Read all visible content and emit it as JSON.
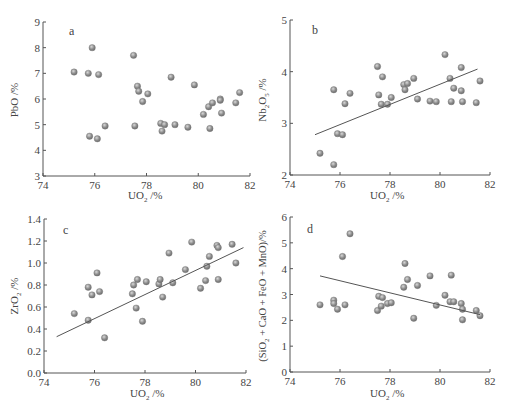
{
  "chart_data": [
    {
      "type": "scatter",
      "panel_label": "a",
      "title": "",
      "xlabel": "UO2 /%",
      "ylabel": "PbO /%",
      "xlim": [
        74,
        82
      ],
      "ylim": [
        3,
        9
      ],
      "xticks": [
        74,
        76,
        78,
        80,
        82
      ],
      "yticks": [
        3,
        4,
        5,
        6,
        7,
        8,
        9
      ],
      "grid": false,
      "trendline": null,
      "points": [
        [
          75.2,
          7.05
        ],
        [
          75.75,
          7.0
        ],
        [
          76.15,
          6.95
        ],
        [
          75.9,
          8.0
        ],
        [
          77.5,
          7.7
        ],
        [
          77.65,
          6.5
        ],
        [
          77.7,
          6.3
        ],
        [
          78.05,
          6.2
        ],
        [
          77.85,
          5.9
        ],
        [
          78.95,
          6.85
        ],
        [
          79.85,
          6.55
        ],
        [
          76.4,
          4.95
        ],
        [
          75.8,
          4.55
        ],
        [
          76.1,
          4.45
        ],
        [
          77.55,
          4.95
        ],
        [
          78.55,
          5.05
        ],
        [
          78.7,
          5.0
        ],
        [
          78.6,
          4.75
        ],
        [
          79.1,
          5.0
        ],
        [
          79.6,
          4.9
        ],
        [
          80.2,
          5.4
        ],
        [
          80.4,
          5.7
        ],
        [
          80.55,
          5.85
        ],
        [
          80.45,
          4.85
        ],
        [
          80.85,
          6.0
        ],
        [
          80.85,
          5.95
        ],
        [
          80.9,
          5.45
        ],
        [
          81.45,
          5.85
        ],
        [
          81.6,
          6.25
        ]
      ]
    },
    {
      "type": "scatter",
      "panel_label": "b",
      "title": "",
      "xlabel": "UO2 /%",
      "ylabel": "Nb2O5 /%",
      "xlim": [
        74,
        82
      ],
      "ylim": [
        2,
        5
      ],
      "xticks": [
        74,
        76,
        78,
        80,
        82
      ],
      "yticks": [
        2,
        3,
        4,
        5
      ],
      "grid": false,
      "trendline": [
        [
          75.0,
          2.78
        ],
        [
          81.5,
          4.05
        ]
      ],
      "points": [
        [
          75.2,
          2.42
        ],
        [
          75.75,
          2.2
        ],
        [
          75.75,
          3.65
        ],
        [
          75.9,
          2.8
        ],
        [
          76.1,
          2.78
        ],
        [
          76.2,
          3.38
        ],
        [
          76.4,
          3.58
        ],
        [
          77.5,
          4.1
        ],
        [
          77.55,
          3.55
        ],
        [
          77.65,
          3.37
        ],
        [
          77.7,
          3.9
        ],
        [
          77.9,
          3.37
        ],
        [
          78.05,
          3.5
        ],
        [
          78.55,
          3.75
        ],
        [
          78.6,
          3.65
        ],
        [
          78.7,
          3.77
        ],
        [
          78.95,
          3.87
        ],
        [
          79.1,
          3.47
        ],
        [
          79.6,
          3.43
        ],
        [
          79.85,
          3.42
        ],
        [
          80.2,
          4.33
        ],
        [
          80.4,
          3.87
        ],
        [
          80.45,
          3.42
        ],
        [
          80.55,
          3.68
        ],
        [
          80.85,
          4.08
        ],
        [
          80.85,
          3.63
        ],
        [
          80.9,
          3.42
        ],
        [
          81.45,
          3.4
        ],
        [
          81.6,
          3.82
        ]
      ]
    },
    {
      "type": "scatter",
      "panel_label": "c",
      "title": "",
      "xlabel": "UO2 /%",
      "ylabel": "ZrO2 /%",
      "xlim": [
        74,
        82
      ],
      "ylim": [
        0.0,
        1.4
      ],
      "xticks": [
        74,
        76,
        78,
        80,
        82
      ],
      "yticks": [
        0.0,
        0.2,
        0.4,
        0.6,
        0.8,
        1.0,
        1.2,
        1.4
      ],
      "grid": false,
      "trendline": [
        [
          74.5,
          0.33
        ],
        [
          81.9,
          1.14
        ]
      ],
      "points": [
        [
          75.2,
          0.54
        ],
        [
          75.75,
          0.78
        ],
        [
          75.75,
          0.48
        ],
        [
          75.9,
          0.71
        ],
        [
          76.1,
          0.91
        ],
        [
          76.2,
          0.74
        ],
        [
          76.4,
          0.32
        ],
        [
          77.5,
          0.72
        ],
        [
          77.55,
          0.8
        ],
        [
          77.65,
          0.59
        ],
        [
          77.7,
          0.85
        ],
        [
          77.9,
          0.47
        ],
        [
          78.05,
          0.83
        ],
        [
          78.55,
          0.81
        ],
        [
          78.6,
          0.85
        ],
        [
          78.7,
          0.69
        ],
        [
          78.95,
          1.09
        ],
        [
          79.1,
          0.82
        ],
        [
          79.6,
          0.94
        ],
        [
          79.85,
          1.19
        ],
        [
          80.2,
          0.77
        ],
        [
          80.4,
          0.84
        ],
        [
          80.45,
          0.97
        ],
        [
          80.55,
          1.06
        ],
        [
          80.85,
          1.16
        ],
        [
          80.9,
          1.14
        ],
        [
          80.9,
          0.85
        ],
        [
          81.45,
          1.17
        ],
        [
          81.6,
          1.0
        ]
      ]
    },
    {
      "type": "scatter",
      "panel_label": "d",
      "title": "",
      "xlabel": "UO2 /%",
      "ylabel": "(SiO2 + CaO + FeO + MnO)/%",
      "xlim": [
        74,
        82
      ],
      "ylim": [
        0,
        6
      ],
      "xticks": [
        74,
        76,
        78,
        80,
        82
      ],
      "yticks": [
        0,
        1,
        2,
        3,
        4,
        5,
        6
      ],
      "grid": false,
      "trendline": [
        [
          75.2,
          3.72
        ],
        [
          81.6,
          2.22
        ]
      ],
      "points": [
        [
          75.2,
          2.6
        ],
        [
          75.75,
          2.78
        ],
        [
          75.75,
          2.65
        ],
        [
          75.9,
          2.43
        ],
        [
          76.1,
          4.47
        ],
        [
          76.2,
          2.6
        ],
        [
          76.4,
          5.35
        ],
        [
          77.5,
          2.38
        ],
        [
          77.55,
          2.93
        ],
        [
          77.65,
          2.55
        ],
        [
          77.7,
          2.88
        ],
        [
          77.9,
          2.65
        ],
        [
          78.05,
          2.68
        ],
        [
          78.55,
          3.28
        ],
        [
          78.6,
          4.2
        ],
        [
          78.7,
          3.58
        ],
        [
          78.95,
          2.08
        ],
        [
          79.1,
          3.35
        ],
        [
          79.6,
          3.72
        ],
        [
          79.85,
          2.58
        ],
        [
          80.2,
          2.97
        ],
        [
          80.4,
          2.72
        ],
        [
          80.45,
          3.75
        ],
        [
          80.55,
          2.72
        ],
        [
          80.85,
          2.65
        ],
        [
          80.9,
          2.43
        ],
        [
          80.9,
          2.02
        ],
        [
          81.45,
          2.38
        ],
        [
          81.6,
          2.18
        ]
      ]
    }
  ],
  "panels": {
    "a": {
      "label": "a",
      "ylabel_main": "PbO",
      "ylabel_sub": "",
      "ylabel_tail": " /%",
      "xlabel_main": "UO",
      "xlabel_sub": "2",
      "xlabel_tail": " /%"
    },
    "b": {
      "label": "b",
      "ylabel_main": "Nb",
      "ylabel_sub": "2",
      "ylabel_mid": "O",
      "ylabel_sub2": "5",
      "ylabel_tail": " /%",
      "xlabel_main": "UO",
      "xlabel_sub": "2",
      "xlabel_tail": " /%"
    },
    "c": {
      "label": "c",
      "ylabel_main": "ZrO",
      "ylabel_sub": "2",
      "ylabel_tail": " /%",
      "xlabel_main": "UO",
      "xlabel_sub": "2",
      "xlabel_tail": " /%"
    },
    "d": {
      "label": "d",
      "ylabel_main": "(SiO",
      "ylabel_sub": "2",
      "ylabel_tail": " + CaO + FeO + MnO)/%",
      "xlabel_main": "UO",
      "xlabel_sub": "2",
      "xlabel_tail": " /%"
    }
  },
  "style": {
    "axis_color": "#555555",
    "point_fill": "#8a8a8a",
    "point_highlight": "#d0d0d0",
    "trend_color": "#555555"
  }
}
